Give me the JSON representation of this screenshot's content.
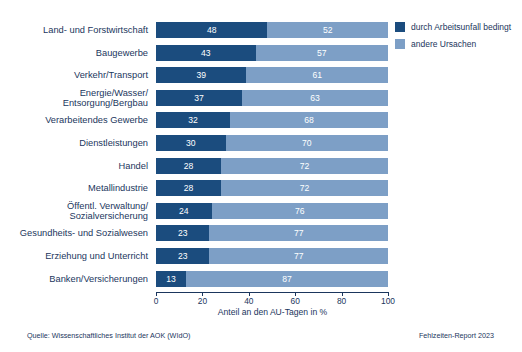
{
  "chart_data": {
    "type": "bar",
    "orientation": "horizontal",
    "stacked": true,
    "title": "",
    "xlabel": "Anteil an den AU-Tagen in %",
    "ylabel": "",
    "xlim": [
      0,
      100
    ],
    "xticks": [
      0,
      20,
      40,
      60,
      80,
      100
    ],
    "grid": false,
    "legend_position": "top-right",
    "categories": [
      "Land- und Forstwirtschaft",
      "Baugewerbe",
      "Verkehr/Transport",
      "Energie/Wasser/\nEntsorgung/Bergbau",
      "Verarbeitendes Gewerbe",
      "Dienstleistungen",
      "Handel",
      "Metallindustrie",
      "Öffentl. Verwaltung/\nSozialversicherung",
      "Gesundheits- und Sozialwesen",
      "Erziehung und Unterricht",
      "Banken/Versicherungen"
    ],
    "series": [
      {
        "name": "durch Arbeitsunfall bedingt",
        "color": "#1b4c7e",
        "values": [
          48,
          43,
          39,
          37,
          32,
          30,
          28,
          28,
          24,
          23,
          23,
          13
        ]
      },
      {
        "name": "andere Ursachen",
        "color": "#7d9fc6",
        "values": [
          52,
          57,
          61,
          63,
          68,
          70,
          72,
          72,
          76,
          77,
          77,
          87
        ]
      }
    ]
  },
  "footer": {
    "source": "Quelle: Wissenschaftliches Institut der AOK (WIdO)",
    "report": "Fehlzeiten-Report 2023"
  }
}
